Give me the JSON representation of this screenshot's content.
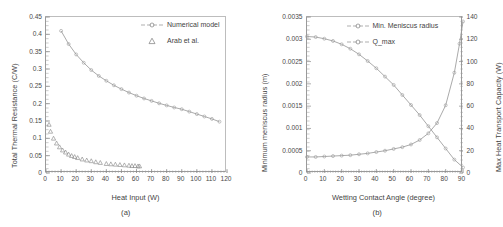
{
  "figure": {
    "panels": [
      {
        "caption": "(a)",
        "xlabel": "Heat Input (W)",
        "ylabel": "Total Thermal Resistance (C/W)"
      },
      {
        "caption": "(b)",
        "xlabel": "Wetting Contact Angle (degree)",
        "ylabel": "Minimum meniscus radius (m)",
        "ylabel_right": "Max Heat Transport Capacity (W)"
      }
    ]
  },
  "chart_data": [
    {
      "type": "line",
      "title": "(a)",
      "xlabel": "Heat Input (W)",
      "ylabel": "Total Thermal Resistance (C/W)",
      "xlim": [
        0,
        120
      ],
      "ylim": [
        0,
        0.45
      ],
      "xticks": [
        0,
        10,
        20,
        30,
        40,
        50,
        60,
        70,
        80,
        90,
        100,
        110,
        120
      ],
      "xtick_labels": [
        "0",
        "10",
        "20",
        "30",
        "40",
        "50",
        "60",
        "70",
        "80",
        "90",
        "100",
        "110",
        "120"
      ],
      "yticks": [
        0,
        0.05,
        0.1,
        0.15,
        0.2,
        0.25,
        0.3,
        0.35,
        0.4,
        0.45
      ],
      "ytick_labels": [
        "0",
        "0.05",
        "0.1",
        "0.15",
        "0.2",
        "0.25",
        "0.3",
        "0.35",
        "0.4",
        "0.45"
      ],
      "grid": false,
      "legend_position": "upper right",
      "series": [
        {
          "name": "Numerical model",
          "style": "line-marker",
          "marker": "circle",
          "color": "#9b9b9b",
          "x": [
            10,
            15,
            20,
            25,
            30,
            35,
            40,
            45,
            50,
            55,
            60,
            65,
            70,
            75,
            80,
            85,
            90,
            95,
            100,
            105,
            110,
            115
          ],
          "y": [
            0.41,
            0.372,
            0.342,
            0.318,
            0.297,
            0.28,
            0.266,
            0.253,
            0.242,
            0.232,
            0.223,
            0.215,
            0.208,
            0.201,
            0.195,
            0.189,
            0.184,
            0.177,
            0.17,
            0.163,
            0.156,
            0.148
          ]
        },
        {
          "name": "Arab et al.",
          "style": "marker-only",
          "marker": "triangle",
          "color": "#8a8a8a",
          "x": [
            2,
            3,
            5,
            7,
            9,
            11,
            13,
            15,
            17,
            19,
            21,
            24,
            27,
            30,
            33,
            36,
            40,
            43,
            46,
            49,
            52,
            55,
            57,
            59,
            61,
            62
          ],
          "y": [
            0.14,
            0.12,
            0.1,
            0.086,
            0.075,
            0.066,
            0.06,
            0.054,
            0.05,
            0.047,
            0.044,
            0.04,
            0.037,
            0.035,
            0.032,
            0.03,
            0.027,
            0.026,
            0.025,
            0.024,
            0.023,
            0.022,
            0.021,
            0.021,
            0.02,
            0.02
          ]
        }
      ]
    },
    {
      "type": "line",
      "title": "(b)",
      "xlabel": "Wetting Contact Angle (degree)",
      "ylabel": "Minimum meniscus radius (m)",
      "ylabel_right": "Max Heat Transport Capacity (W)",
      "xlim": [
        0,
        90
      ],
      "ylim": [
        0,
        0.0035
      ],
      "ylim_right": [
        0,
        140
      ],
      "xticks": [
        0,
        10,
        20,
        30,
        40,
        50,
        60,
        70,
        80,
        90
      ],
      "xtick_labels": [
        "0",
        "10",
        "20",
        "30",
        "40",
        "50",
        "60",
        "70",
        "80",
        "90"
      ],
      "yticks": [
        0,
        0.0005,
        0.001,
        0.0015,
        0.002,
        0.0025,
        0.003,
        0.0035
      ],
      "ytick_labels": [
        "0",
        "0.0005",
        "0.001",
        "0.0015",
        "0.002",
        "0.0025",
        "0.003",
        "0.0035"
      ],
      "yticks_right": [
        0,
        20,
        40,
        60,
        80,
        100,
        120,
        140
      ],
      "ytick_labels_right": [
        "0",
        "20",
        "40",
        "60",
        "80",
        "100",
        "120",
        "140"
      ],
      "grid": false,
      "legend_position": "upper right",
      "series": [
        {
          "name": "Min. Meniscus radius",
          "axis": "right",
          "style": "line-marker",
          "marker": "circle",
          "color": "#9b9b9b",
          "x": [
            0,
            5,
            10,
            15,
            20,
            25,
            30,
            35,
            40,
            45,
            50,
            55,
            60,
            65,
            70,
            75,
            80,
            85,
            90
          ],
          "y": [
            122.5,
            122.0,
            120.5,
            118.5,
            115.5,
            111.5,
            106.5,
            100.5,
            94.0,
            86.5,
            79.0,
            70.0,
            61.0,
            52.0,
            42.0,
            32.0,
            22.0,
            12.0,
            5.0
          ]
        },
        {
          "name": "Q_max",
          "axis": "left",
          "style": "line-marker",
          "marker": "circle",
          "color": "#9b9b9b",
          "x": [
            0,
            5,
            10,
            15,
            20,
            25,
            30,
            35,
            40,
            45,
            50,
            55,
            60,
            65,
            70,
            75,
            80,
            85,
            88,
            90
          ],
          "y": [
            0.00036,
            0.00036,
            0.00037,
            0.00038,
            0.00039,
            0.0004,
            0.00042,
            0.00044,
            0.00047,
            0.0005,
            0.00054,
            0.00058,
            0.00064,
            0.00074,
            0.00089,
            0.00112,
            0.00152,
            0.00225,
            0.0029,
            0.0034
          ]
        }
      ]
    }
  ]
}
